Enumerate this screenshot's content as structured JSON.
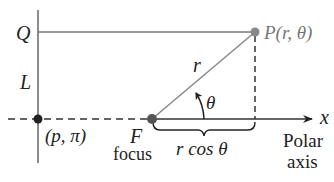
{
  "labels": {
    "Q": "Q",
    "L": "L",
    "P": "P(r, θ)",
    "r": "r",
    "theta": "θ",
    "x": "x",
    "p_pi": "(p, π)",
    "F": "F",
    "focus": "focus",
    "rcos": "r cos θ",
    "polar": "Polar",
    "axis": "axis"
  },
  "colors": {
    "line": "#666666",
    "point": "#555555",
    "dark": "#222222",
    "p_label": "#777777"
  }
}
